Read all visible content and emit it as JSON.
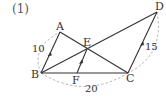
{
  "problem": {
    "number": "(1)"
  },
  "points": {
    "A": {
      "label": "A",
      "x": 60,
      "y": 32
    },
    "B": {
      "label": "B",
      "x": 41,
      "y": 73
    },
    "C": {
      "label": "C",
      "x": 128,
      "y": 73
    },
    "D": {
      "label": "D",
      "x": 157,
      "y": 12
    },
    "E": {
      "label": "E",
      "x": 87,
      "y": 49
    },
    "F": {
      "label": "F",
      "x": 77,
      "y": 73
    }
  },
  "segments": [
    {
      "from": "A",
      "to": "B",
      "parallel_arrow": true
    },
    {
      "from": "A",
      "to": "C",
      "parallel_arrow": false
    },
    {
      "from": "B",
      "to": "C",
      "parallel_arrow": false
    },
    {
      "from": "B",
      "to": "D",
      "parallel_arrow": false
    },
    {
      "from": "D",
      "to": "C",
      "parallel_arrow": true
    },
    {
      "from": "E",
      "to": "F",
      "parallel_arrow": true
    }
  ],
  "measurements": {
    "AB": "10",
    "DC": "15",
    "BC": "20"
  },
  "colors": {
    "line": "#333333",
    "dashed_arc": "#aaaaaa",
    "text": "#333333"
  }
}
